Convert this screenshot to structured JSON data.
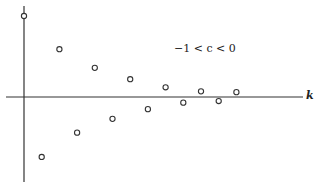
{
  "chart_data": {
    "type": "scatter",
    "title": "",
    "annotation": "−1 < c < 0",
    "xlabel": "k",
    "ylabel": "",
    "grid": false,
    "legend": null,
    "marker": "open-circle",
    "x": [
      0,
      1,
      2,
      3,
      4,
      5,
      6,
      7,
      8,
      9,
      10,
      11,
      12
    ],
    "values": [
      1.0,
      -0.74,
      0.59,
      -0.44,
      0.36,
      -0.27,
      0.22,
      -0.15,
      0.12,
      -0.07,
      0.07,
      -0.05,
      0.06
    ],
    "xlim": [
      0,
      15
    ],
    "ylim": [
      -1.1,
      1.1
    ]
  },
  "labels": {
    "annotation": "−1 < c < 0",
    "x_axis": "k"
  }
}
